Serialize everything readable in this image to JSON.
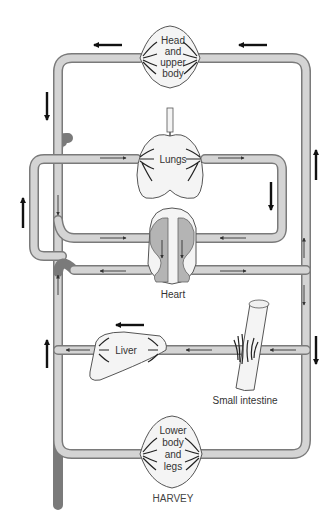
{
  "diagram": {
    "title": "HARVEY",
    "organs": [
      {
        "id": "head",
        "label_lines": [
          "Head",
          "and",
          "upper",
          "body"
        ]
      },
      {
        "id": "lungs",
        "label_lines": [
          "Lungs"
        ]
      },
      {
        "id": "heart",
        "label_lines": [
          "Heart"
        ]
      },
      {
        "id": "liver",
        "label_lines": [
          "Liver"
        ]
      },
      {
        "id": "small-intestine",
        "label_lines": [
          "Small intestine"
        ]
      },
      {
        "id": "lower-body",
        "label_lines": [
          "Lower",
          "body",
          "and",
          "legs"
        ]
      }
    ],
    "colors": {
      "vessel_fill": "#d4d4d4",
      "vessel_edge": "#7a7a7a",
      "heart_chamber": "#b4b4b4",
      "arrow": "#111111",
      "text": "#333333"
    }
  }
}
